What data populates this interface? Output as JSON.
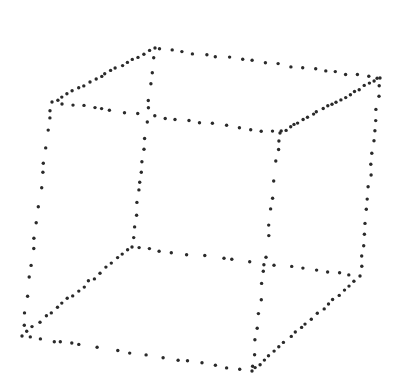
{
  "diagram": {
    "title": "Dotted wireframe cube (Necker cube)",
    "background": "#ffffff",
    "dot_color": "#2a2a2a",
    "dot_radius": 1.7,
    "vertices": {
      "BTL": [
        155,
        48
      ],
      "BTR": [
        380,
        78
      ],
      "FTL": [
        52,
        102
      ],
      "FTR": [
        280,
        133
      ],
      "BBL": [
        132,
        247
      ],
      "BBR": [
        360,
        276
      ],
      "FBL": [
        22,
        336
      ],
      "FBR": [
        252,
        371
      ]
    },
    "edges": [
      {
        "name": "top-back",
        "from": "BTL",
        "to": "BTR",
        "t": [
          0.02,
          0.08,
          0.12,
          0.17,
          0.23,
          0.27,
          0.33,
          0.39,
          0.43,
          0.49,
          0.55,
          0.6,
          0.66,
          0.71,
          0.76,
          0.8,
          0.85,
          0.9,
          0.95,
          0.99
        ]
      },
      {
        "name": "top-left",
        "from": "BTL",
        "to": "FTL",
        "t": [
          0.05,
          0.1,
          0.16,
          0.22,
          0.27,
          0.32,
          0.38,
          0.43,
          0.48,
          0.52,
          0.58,
          0.63,
          0.69,
          0.74,
          0.8,
          0.86,
          0.9,
          0.95
        ]
      },
      {
        "name": "top-front",
        "from": "FTL",
        "to": "FTR",
        "t": [
          0.04,
          0.09,
          0.14,
          0.19,
          0.22,
          0.25,
          0.32,
          0.38,
          0.45,
          0.5,
          0.54,
          0.6,
          0.65,
          0.7,
          0.77,
          0.82,
          0.87,
          0.92,
          0.97
        ]
      },
      {
        "name": "top-right",
        "from": "FTR",
        "to": "BTR",
        "t": [
          0.02,
          0.06,
          0.1,
          0.14,
          0.18,
          0.24,
          0.28,
          0.33,
          0.37,
          0.43,
          0.48,
          0.52,
          0.57,
          0.61,
          0.66,
          0.7,
          0.75,
          0.8,
          0.85,
          0.9,
          0.95
        ]
      },
      {
        "name": "vertical-back-left",
        "from": "BTL",
        "to": "BBL",
        "t": [
          0.05,
          0.12,
          0.18,
          0.26,
          0.3,
          0.37,
          0.45,
          0.51,
          0.57,
          0.62,
          0.67,
          0.71,
          0.78,
          0.84,
          0.9,
          0.95
        ]
      },
      {
        "name": "vertical-back-right",
        "from": "BTR",
        "to": "BBR",
        "t": [
          0.04,
          0.09,
          0.16,
          0.21,
          0.27,
          0.32,
          0.38,
          0.44,
          0.49,
          0.55,
          0.61,
          0.66,
          0.73,
          0.79,
          0.85,
          0.9,
          0.95
        ]
      },
      {
        "name": "vertical-front-left",
        "from": "FTL",
        "to": "FBL",
        "t": [
          0.04,
          0.07,
          0.12,
          0.2,
          0.26,
          0.3,
          0.37,
          0.45,
          0.52,
          0.58,
          0.63,
          0.7,
          0.75,
          0.83,
          0.9,
          0.95
        ]
      },
      {
        "name": "vertical-front-right",
        "from": "FTR",
        "to": "FBR",
        "t": [
          0.03,
          0.07,
          0.12,
          0.2,
          0.27,
          0.32,
          0.39,
          0.43,
          0.52,
          0.58,
          0.63,
          0.7,
          0.76,
          0.82,
          0.87,
          0.93,
          0.98
        ]
      },
      {
        "name": "bottom-back",
        "from": "BBL",
        "to": "BBR",
        "t": [
          0.03,
          0.08,
          0.12,
          0.17,
          0.24,
          0.32,
          0.4,
          0.44,
          0.52,
          0.58,
          0.62,
          0.7,
          0.75,
          0.81,
          0.86,
          0.91,
          0.95
        ]
      },
      {
        "name": "bottom-left",
        "from": "BBL",
        "to": "FBL",
        "t": [
          0.04,
          0.08,
          0.13,
          0.19,
          0.23,
          0.29,
          0.35,
          0.39,
          0.44,
          0.49,
          0.54,
          0.58,
          0.64,
          0.68,
          0.73,
          0.78,
          0.84,
          0.9,
          0.95
        ]
      },
      {
        "name": "bottom-front",
        "from": "FBL",
        "to": "FBR",
        "t": [
          0.04,
          0.08,
          0.14,
          0.17,
          0.22,
          0.25,
          0.33,
          0.42,
          0.47,
          0.54,
          0.61,
          0.68,
          0.72,
          0.78,
          0.84,
          0.89,
          0.95
        ]
      },
      {
        "name": "bottom-right",
        "from": "FBR",
        "to": "BBR",
        "t": [
          0.03,
          0.07,
          0.12,
          0.16,
          0.2,
          0.25,
          0.3,
          0.36,
          0.41,
          0.46,
          0.5,
          0.55,
          0.6,
          0.66,
          0.7,
          0.75,
          0.8,
          0.85,
          0.9,
          0.95
        ]
      }
    ]
  }
}
